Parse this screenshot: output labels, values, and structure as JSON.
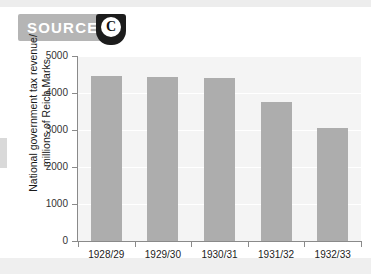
{
  "badge": {
    "label": "SOURCE",
    "letter": "C",
    "banner_color": "#b5b5b5",
    "shield_color": "#1c1c1c"
  },
  "chart_data": {
    "type": "bar",
    "title": "",
    "xlabel": "",
    "ylabel": "National government tax revenue/ millions of Reich Marks",
    "ylabel_line1": "National government tax revenue/",
    "ylabel_line2": "millions of Reich Marks",
    "categories": [
      "1928/29",
      "1929/30",
      "1930/31",
      "1931/32",
      "1932/33"
    ],
    "values": [
      4450,
      4420,
      4400,
      3770,
      3050
    ],
    "ylim": [
      0,
      5000
    ],
    "ytick_labels": [
      "0",
      "1000",
      "2000",
      "3000",
      "4000",
      "5000"
    ],
    "ytick_values": [
      0,
      1000,
      2000,
      3000,
      4000,
      5000
    ],
    "grid": true,
    "legend": "none",
    "bar_color": "#adadad",
    "plot_background": "#f4f4f4",
    "axis_color": "#8a8a8a"
  }
}
